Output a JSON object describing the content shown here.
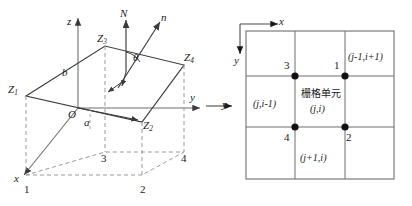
{
  "figure": {
    "panels": [
      {
        "id": "left",
        "caption_axes": {
          "z_axis": "z",
          "y_axis": "y",
          "x_axis": "x",
          "origin": "O"
        },
        "normals": {
          "global_normal": "N",
          "surface_normal": "n",
          "angle": "θ"
        },
        "dimensions": {
          "height": "b",
          "depth": "a"
        },
        "surface_vertices": [
          {
            "name": "Z",
            "index": "1"
          },
          {
            "name": "Z",
            "index": "2"
          },
          {
            "name": "Z",
            "index": "3"
          },
          {
            "name": "Z",
            "index": "4"
          }
        ],
        "base_corners": [
          "1",
          "2",
          "3",
          "4"
        ]
      },
      {
        "id": "right",
        "axes": {
          "x_axis": "x",
          "y_axis": "y",
          "y_axis_outer": "y"
        },
        "center_cell": {
          "title": "栅格单元",
          "index": "(j,i)"
        },
        "neighbor_cells": [
          {
            "position": "top-right",
            "index": "(j-1,i+1)"
          },
          {
            "position": "left",
            "index": "(j,i-1)"
          },
          {
            "position": "bottom",
            "index": "(j+1,i)"
          }
        ],
        "nodes": [
          {
            "label": "1",
            "position": "top-right"
          },
          {
            "label": "2",
            "position": "bottom-right"
          },
          {
            "label": "3",
            "position": "top-left"
          },
          {
            "label": "4",
            "position": "bottom-left"
          }
        ]
      }
    ]
  },
  "style": {
    "line_color": "#3a3a3a",
    "dash_color": "#9a9a9a",
    "grid_color": "#6e6e6e",
    "node_color": "#111111"
  }
}
